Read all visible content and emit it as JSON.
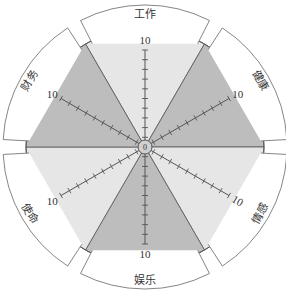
{
  "diagram": {
    "type": "wheel-of-life",
    "center": {
      "x": 145,
      "y": 147
    },
    "radius": 119,
    "tab_inner_radius": 122,
    "tab_outer_radius": 142,
    "scale_max": "10",
    "ticks_per_spoke": 10,
    "colors": {
      "light_sector": "#e6e6e6",
      "dark_sector": "#bdbdbd",
      "line": "#555555",
      "tab_fill": "#ffffff",
      "tab_stroke": "#777777"
    },
    "sectors": [
      {
        "label": "工作",
        "angle": -90,
        "shade": "light"
      },
      {
        "label": "健康",
        "angle": -30,
        "shade": "dark"
      },
      {
        "label": "情感",
        "angle": 30,
        "shade": "light"
      },
      {
        "label": "娱乐",
        "angle": 90,
        "shade": "dark"
      },
      {
        "label": "使命",
        "angle": 150,
        "shade": "light"
      },
      {
        "label": "财务",
        "angle": 210,
        "shade": "dark"
      }
    ],
    "center_label": "0"
  }
}
